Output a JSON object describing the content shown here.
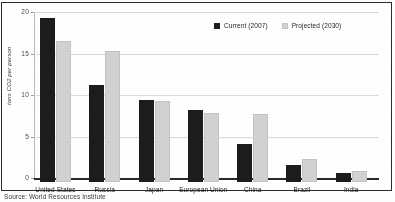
{
  "chart_data": {
    "type": "bar",
    "title": "",
    "xlabel": "",
    "ylabel": "tons CO2 per person",
    "ylim": [
      0,
      20
    ],
    "yticks": [
      0,
      5,
      10,
      15,
      20
    ],
    "ytick_labels": [
      "0",
      "5",
      "10",
      "15",
      "20"
    ],
    "grid": true,
    "legend_position": "top-right",
    "categories": [
      "United States",
      "Russia",
      "Japan",
      "European Union",
      "China",
      "Brazil",
      "India"
    ],
    "series": [
      {
        "name": "Current (2007)",
        "color": "#1c1c1c",
        "values": [
          19.8,
          11.7,
          9.9,
          8.7,
          4.6,
          2.0,
          1.1
        ]
      },
      {
        "name": "Projected (2030)",
        "color": "#d2d2d2",
        "values": [
          17.0,
          15.8,
          9.8,
          8.3,
          8.2,
          2.8,
          1.3
        ]
      }
    ]
  },
  "legend": {
    "items": [
      {
        "label": "Current (2007)",
        "swatch": "current"
      },
      {
        "label": "Projected (2030)",
        "swatch": "projected"
      }
    ]
  },
  "axis": {
    "y_title": "tons CO2 per person"
  },
  "caption": {
    "source": "Source: World Resources Institute"
  }
}
